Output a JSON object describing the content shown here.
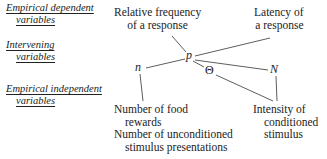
{
  "row_labels": {
    "dependent": [
      "Empirical dependent",
      "variables"
    ],
    "intervening": [
      "Intervening",
      "variables"
    ],
    "independent": [
      "Empirical independent",
      "variables"
    ]
  },
  "dependent_nodes": {
    "relative_frequency": [
      "Relative frequency",
      "of a response"
    ],
    "latency": [
      "Latency of",
      "a response"
    ]
  },
  "intervening_symbols": {
    "n": "n",
    "p": "p",
    "theta": "Θ",
    "N": "N"
  },
  "independent_nodes": {
    "food_rewards": [
      "Number of food",
      "rewards"
    ],
    "unconditioned": [
      "Number of unconditioned",
      "stimulus presentations"
    ],
    "intensity": [
      "Intensity of",
      "conditioned",
      "stimulus"
    ]
  },
  "colors": {
    "ink": "#222222",
    "line": "#333333"
  }
}
